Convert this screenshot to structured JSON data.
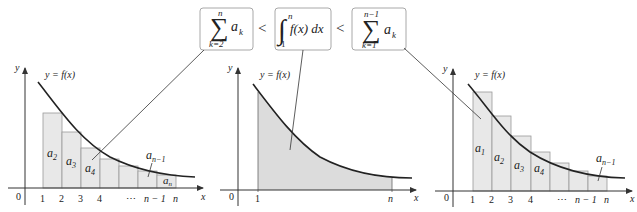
{
  "colors": {
    "curve": "#222222",
    "axis": "#333333",
    "fill": "#e6e6e6",
    "fill_integral": "#dcdcdc",
    "rect_stroke": "#9a9a9a",
    "box_stroke": "#a8a8a8",
    "pointer": "#333333",
    "text": "#222222"
  },
  "formula": {
    "box1": {
      "sym": "∑",
      "upper": "n",
      "lower": "k=2",
      "term": "a",
      "term_sub": "k"
    },
    "lt1": "<",
    "box2": {
      "sym": "∫",
      "upper": "n",
      "lower": "1",
      "body": "f(x) dx"
    },
    "lt2": "<",
    "box3": {
      "sym": "∑",
      "upper": "n−1",
      "lower": "k=1",
      "term": "a",
      "term_sub": "k"
    }
  },
  "graphs": {
    "left": {
      "y_label": "y",
      "x_label": "x",
      "origin_label": "0",
      "curve_label": "y = f(x)",
      "ticks": [
        "1",
        "2",
        "3",
        "4",
        "⋯",
        "n − 1",
        "n"
      ],
      "area_labels": [
        {
          "base": "a",
          "sub": "2"
        },
        {
          "base": "a",
          "sub": "3"
        },
        {
          "base": "a",
          "sub": "4"
        },
        {
          "base": "a",
          "sub": "n−1"
        },
        {
          "base": "a",
          "sub": "n"
        }
      ]
    },
    "middle": {
      "y_label": "y",
      "x_label": "x",
      "origin_label": "0",
      "curve_label": "y = f(x)",
      "ticks": [
        "1",
        "n"
      ]
    },
    "right": {
      "y_label": "y",
      "x_label": "x",
      "origin_label": "0",
      "curve_label": "y = f(x)",
      "ticks": [
        "1",
        "2",
        "3",
        "4",
        "⋯",
        "n − 1",
        "n"
      ],
      "area_labels": [
        {
          "base": "a",
          "sub": "1"
        },
        {
          "base": "a",
          "sub": "2"
        },
        {
          "base": "a",
          "sub": "3"
        },
        {
          "base": "a",
          "sub": "4"
        },
        {
          "base": "a",
          "sub": "n−1"
        }
      ]
    }
  }
}
